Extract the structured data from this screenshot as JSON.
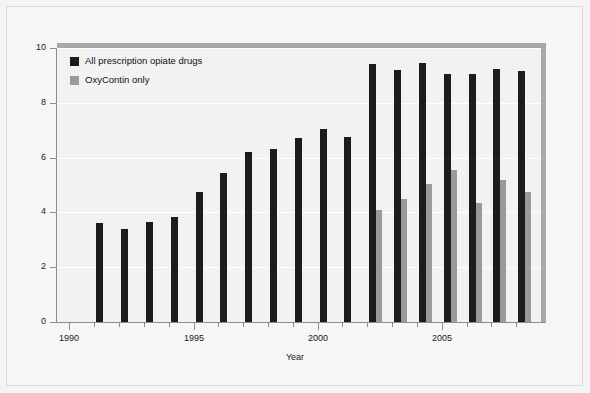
{
  "chart_data": {
    "type": "bar",
    "title": "",
    "xlabel": "Year",
    "ylabel": "Percent",
    "ylim": [
      0,
      10
    ],
    "y_ticks": [
      0,
      2,
      4,
      6,
      8,
      10
    ],
    "y_tick_labels": [
      "0",
      "2",
      "4",
      "6",
      "8",
      "10"
    ],
    "xlim": [
      1989.5,
      2009
    ],
    "x_ticks_major": [
      1990,
      1995,
      2000,
      2005
    ],
    "x_tick_labels": [
      "1990",
      "1995",
      "2000",
      "2005"
    ],
    "x_ticks_minor": [
      1990,
      1991,
      1992,
      1993,
      1994,
      1995,
      1996,
      1997,
      1998,
      1999,
      2000,
      2001,
      2002,
      2003,
      2004,
      2005,
      2006,
      2007,
      2008
    ],
    "grid": "horizontal",
    "legend_position": "top-left",
    "categories": [
      1991,
      1992,
      1993,
      1994,
      1995,
      1996,
      1997,
      1998,
      1999,
      2000,
      2001,
      2002,
      2003,
      2004,
      2005,
      2006,
      2007,
      2008
    ],
    "series": [
      {
        "name": "All prescription opiate drugs",
        "color": "#1c1c1c",
        "values": [
          3.6,
          3.4,
          3.65,
          3.85,
          4.75,
          5.45,
          6.2,
          6.3,
          6.7,
          7.05,
          6.75,
          9.4,
          9.2,
          9.45,
          9.05,
          9.05,
          9.25,
          9.15
        ]
      },
      {
        "name": "OxyContin only",
        "color": "#9a9a9a",
        "values": [
          null,
          null,
          null,
          null,
          null,
          null,
          null,
          null,
          null,
          null,
          null,
          4.1,
          4.5,
          5.05,
          5.55,
          4.35,
          5.2,
          4.75
        ]
      }
    ]
  },
  "legend": {
    "items": [
      {
        "label": "All prescription opiate drugs",
        "color": "#1c1c1c"
      },
      {
        "label": "OxyContin only",
        "color": "#9a9a9a"
      }
    ]
  },
  "axes": {
    "y_title": "Percent",
    "x_title": "Year"
  }
}
